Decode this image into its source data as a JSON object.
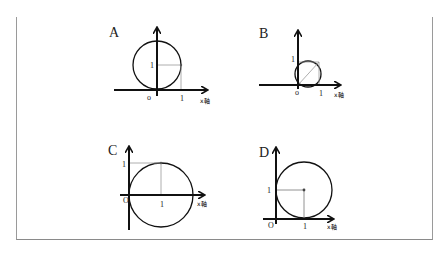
{
  "panels": [
    {
      "id": "A",
      "label": "A",
      "y_tick": "1",
      "origin": "o",
      "x_tick": "1",
      "axis_name": "x軸",
      "circle": {
        "cx": 157,
        "cy": 65,
        "r": 24
      },
      "description": "Circle tangent to x-axis at origin, center (0,1)"
    },
    {
      "id": "B",
      "label": "B",
      "y_tick": "1",
      "origin": "o",
      "x_tick": "1",
      "axis_name": "x軸",
      "circle": {
        "cx": 309,
        "cy": 74,
        "r": 13
      },
      "description": "Small circle through origin with unit square and diagonal"
    },
    {
      "id": "C",
      "label": "C",
      "y_tick": "1",
      "origin": "O",
      "x_tick": "1",
      "axis_name": "x軸",
      "circle": {
        "cx": 161,
        "cy": 195,
        "r": 32
      },
      "description": "Circle centered on x-axis at (1,0) passing through origin"
    },
    {
      "id": "D",
      "label": "D",
      "y_tick": "1",
      "origin": "O",
      "x_tick": "1",
      "axis_name": "x軸",
      "circle": {
        "cx": 303,
        "cy": 190,
        "r": 29
      },
      "description": "Circle tangent to both axes, center (1,1)"
    }
  ]
}
